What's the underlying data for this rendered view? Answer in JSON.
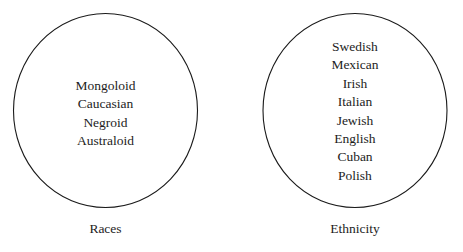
{
  "figure": {
    "type": "two-set-comparison-diagram",
    "background_color": "#ffffff",
    "outline_color": "#1a1a1a"
  },
  "groups": [
    {
      "id": "races",
      "caption": "Races",
      "circle": {
        "cx": 92.5,
        "cy": 97.5,
        "r": 92,
        "stroke": "#1a1a1a",
        "stroke_width": 1.1,
        "fill": "none"
      },
      "items": [
        "Mongoloid",
        "Caucasian",
        "Negroid",
        "Australoid"
      ]
    },
    {
      "id": "ethnicity",
      "caption": "Ethnicity",
      "circle": {
        "cx": 92,
        "cy": 97.5,
        "r": 92,
        "stroke": "#1a1a1a",
        "stroke_width": 1.1,
        "fill": "none"
      },
      "items": [
        "Swedish",
        "Mexican",
        "Irish",
        "Italian",
        "Jewish",
        "English",
        "Cuban",
        "Polish"
      ]
    }
  ]
}
